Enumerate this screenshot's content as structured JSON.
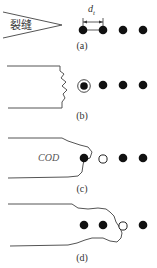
{
  "panels": [
    {
      "id": "a",
      "label": "(a)",
      "crack_text": "裂缝",
      "spacing_label": "d",
      "spacing_sub": "t"
    },
    {
      "id": "b",
      "label": "(b)"
    },
    {
      "id": "c",
      "label": "(c)",
      "annotation": "COD"
    },
    {
      "id": "d",
      "label": "(d)"
    }
  ],
  "colors": {
    "line": "#555555",
    "dot": "#111111",
    "open_dot": "#ffffff"
  }
}
